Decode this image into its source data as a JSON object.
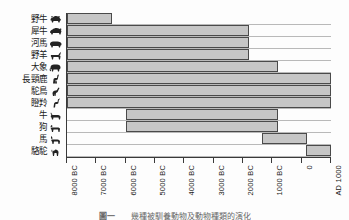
{
  "figure": {
    "caption_number": "圖一",
    "caption_text": "幾種被馴養動物及動物種類的演化"
  },
  "axis": {
    "ticks": [
      "8000 BC",
      "7000 BC",
      "6000 BC",
      "5000 BC",
      "4000 BC",
      "3000 BC",
      "2000 BC",
      "1000 BC",
      "0",
      "AD 1000"
    ],
    "tick_values": [
      -8000,
      -7000,
      -6000,
      -5000,
      -4000,
      -3000,
      -2000,
      -1000,
      0,
      1000
    ],
    "min": -8000,
    "max": 1000
  },
  "style": {
    "bar_fill": "#c6c6c6",
    "bar_stroke": "#4a4a4a",
    "grid_color": "#b9b9b9",
    "axis_color": "#3a3a3a"
  },
  "rows": [
    {
      "label": "野牛",
      "icon": "bison-icon",
      "start": -8000,
      "end": -6450
    },
    {
      "label": "犀牛",
      "icon": "rhinoceros-icon",
      "start": -8000,
      "end": -1780
    },
    {
      "label": "河馬",
      "icon": "hippopotamus-icon",
      "start": -8000,
      "end": -1780
    },
    {
      "label": "野羊",
      "icon": "wild-goat-icon",
      "start": -8000,
      "end": -1780
    },
    {
      "label": "大象",
      "icon": "elephant-icon",
      "start": -8000,
      "end": -800
    },
    {
      "label": "長頸鹿",
      "icon": "giraffe-icon",
      "start": -8000,
      "end": 1000
    },
    {
      "label": "駝鳥",
      "icon": "ostrich-icon",
      "start": -8000,
      "end": 1000
    },
    {
      "label": "瞪羚",
      "icon": "gazelle-icon",
      "start": -8000,
      "end": 1000
    },
    {
      "label": "牛",
      "icon": "cattle-icon",
      "start": -6000,
      "end": -800
    },
    {
      "label": "狗",
      "icon": "dog-icon",
      "start": -6000,
      "end": -800
    },
    {
      "label": "馬",
      "icon": "horse-icon",
      "start": -1350,
      "end": 170
    },
    {
      "label": "駱駝",
      "icon": "camel-icon",
      "start": 160,
      "end": 1000
    }
  ],
  "chart_data": {
    "type": "bar",
    "title": "",
    "xlabel": "",
    "ylabel": "",
    "orientation": "horizontal",
    "bar_style": "range",
    "grid": true,
    "legend": "none",
    "xlim": [
      -8000,
      1000
    ],
    "xticks": [
      -8000,
      -7000,
      -6000,
      -5000,
      -4000,
      -3000,
      -2000,
      -1000,
      0,
      1000
    ],
    "xticklabels": [
      "8000 BC",
      "7000 BC",
      "6000 BC",
      "5000 BC",
      "4000 BC",
      "3000 BC",
      "2000 BC",
      "1000 BC",
      "0",
      "AD 1000"
    ],
    "categories": [
      "野牛",
      "犀牛",
      "河馬",
      "野羊",
      "大象",
      "長頸鹿",
      "駝鳥",
      "瞪羚",
      "牛",
      "狗",
      "馬",
      "駱駝"
    ],
    "ranges": [
      [
        -8000,
        -6450
      ],
      [
        -8000,
        -1780
      ],
      [
        -8000,
        -1780
      ],
      [
        -8000,
        -1780
      ],
      [
        -8000,
        -800
      ],
      [
        -8000,
        1000
      ],
      [
        -8000,
        1000
      ],
      [
        -8000,
        1000
      ],
      [
        -6000,
        -800
      ],
      [
        -6000,
        -800
      ],
      [
        -1350,
        170
      ],
      [
        160,
        1000
      ]
    ]
  }
}
